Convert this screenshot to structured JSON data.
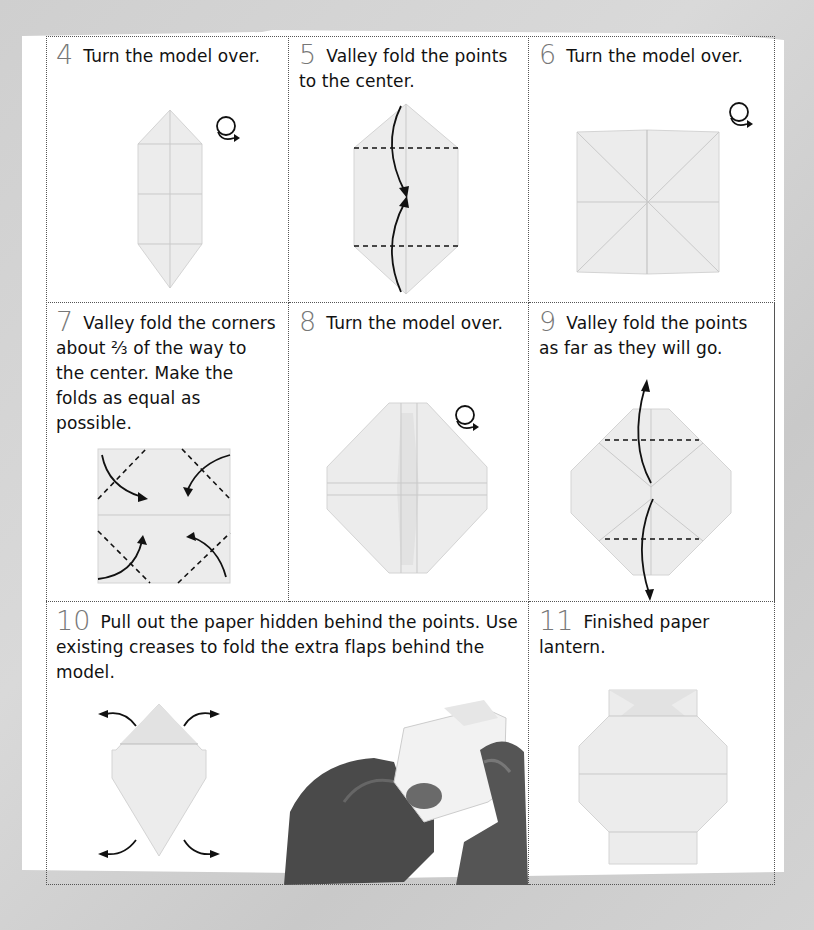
{
  "steps": [
    {
      "number": "4",
      "text": "Turn the model over.",
      "icon": "turn-over-icon"
    },
    {
      "number": "5",
      "text": "Valley fold the points to the center.",
      "icon": "valley-fold-arrows-icon"
    },
    {
      "number": "6",
      "text": "Turn the model over.",
      "icon": "turn-over-icon"
    },
    {
      "number": "7",
      "text": "Valley fold the corners about ⅔ of the way to the center. Make the folds as equal as possible.",
      "icon": "corner-fold-arrows-icon"
    },
    {
      "number": "8",
      "text": "Turn the model over.",
      "icon": "turn-over-icon"
    },
    {
      "number": "9",
      "text": "Valley fold the points as far as they will go.",
      "icon": "valley-fold-arrows-icon"
    },
    {
      "number": "10",
      "text": "Pull out the paper hidden behind the points. Use existing creases to fold the extra flaps behind the model.",
      "icon": "pull-out-arrows-icon"
    },
    {
      "number": "11",
      "text": "Finished paper lantern.",
      "icon": "finished-lantern"
    }
  ],
  "colors": {
    "background": "#d2d2d2",
    "sheet": "#ffffff",
    "step_number": "#777777",
    "text": "#111111",
    "paper": "#ececec",
    "grid_border": "#555555"
  }
}
